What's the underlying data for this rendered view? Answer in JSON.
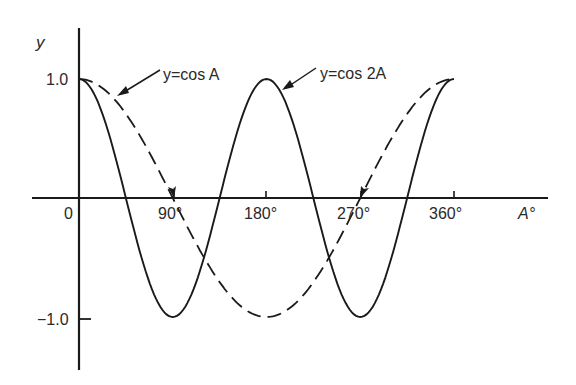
{
  "chart_data": {
    "type": "line",
    "title": "",
    "xlabel": "A°",
    "ylabel": "y",
    "xlim": [
      0,
      360
    ],
    "ylim": [
      -1.0,
      1.0
    ],
    "x_ticks": [
      "0",
      "90°",
      "180°",
      "270°",
      "360°"
    ],
    "x_tick_values": [
      0,
      90,
      180,
      270,
      360
    ],
    "y_ticks": [
      "1.0",
      "-1.0"
    ],
    "y_tick_values": [
      1.0,
      -1.0
    ],
    "grid": false,
    "legend": "none (curves labeled by arrow annotations)",
    "x": [
      0,
      45,
      90,
      135,
      180,
      225,
      270,
      315,
      360
    ],
    "series": [
      {
        "name": "y=cos A",
        "style": "dashed",
        "values": [
          1.0,
          0.707,
          0.0,
          -0.707,
          -1.0,
          -0.707,
          0.0,
          0.707,
          1.0
        ]
      },
      {
        "name": "y=cos 2A",
        "style": "solid",
        "values": [
          1.0,
          0.0,
          -1.0,
          0.0,
          1.0,
          0.0,
          -1.0,
          0.0,
          1.0
        ]
      }
    ],
    "annotations": [
      {
        "text": "y=cos A",
        "points_to": "dashed curve near A≈30°"
      },
      {
        "text": "y=cos 2A",
        "points_to": "solid curve near A≈190°"
      }
    ]
  },
  "labels": {
    "y_axis": "y",
    "x_axis": "A°",
    "origin": "0",
    "tick_90": "90°",
    "tick_180": "180°",
    "tick_270": "270°",
    "tick_360": "360°",
    "y_pos": "1.0",
    "y_neg": "−1.0",
    "annot_cosA": "y=cos A",
    "annot_cos2A": "y=cos 2A"
  },
  "colors": {
    "ink": "#1a1a1a",
    "background": "#ffffff"
  }
}
